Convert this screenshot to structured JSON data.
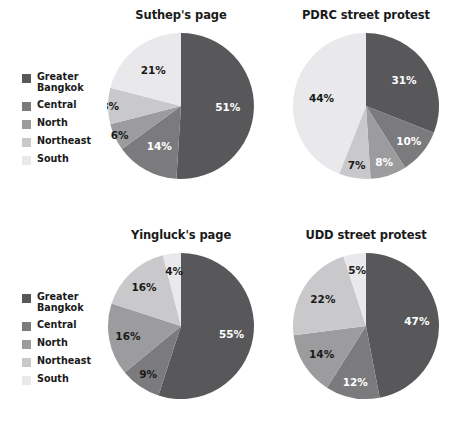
{
  "figure": {
    "background": "#ffffff",
    "width": 465,
    "height": 443
  },
  "legend": {
    "title": "",
    "position": "left-of-row",
    "items": [
      {
        "label": "Greater\nBangkok",
        "color": "#58585a"
      },
      {
        "label": "Central",
        "color": "#7b7b7d"
      },
      {
        "label": "North",
        "color": "#9c9c9e"
      },
      {
        "label": "Northeast",
        "color": "#c9c9cb"
      },
      {
        "label": "South",
        "color": "#e9e9eb"
      }
    ]
  },
  "palette": {
    "greater_bangkok": "#58585a",
    "central": "#7b7b7d",
    "north": "#9c9c9e",
    "northeast": "#c9c9cb",
    "south": "#e9e9eb",
    "label_light": "#ffffff",
    "label_dark": "#1a1a1a",
    "title": "#1a1a1a"
  },
  "chart_data": [
    {
      "type": "pie",
      "title": "Suthep's page",
      "categories": [
        "Greater Bangkok",
        "Central",
        "North",
        "Northeast",
        "South"
      ],
      "values": [
        51,
        14,
        6,
        8,
        21
      ],
      "labels": [
        "51%",
        "14%",
        "6%",
        "8%",
        "21%"
      ],
      "colors": [
        "#58585a",
        "#7b7b7d",
        "#9c9c9e",
        "#c9c9cb",
        "#e9e9eb"
      ],
      "label_colors": [
        "#ffffff",
        "#ffffff",
        "#1a1a1a",
        "#1a1a1a",
        "#1a1a1a"
      ],
      "label_radius": [
        0.64,
        0.62,
        0.93,
        0.97,
        0.62
      ],
      "start_angle": 0,
      "direction": "clockwise",
      "xlabel": "",
      "ylabel": ""
    },
    {
      "type": "pie",
      "title": "PDRC street protest",
      "categories": [
        "Greater Bangkok",
        "Central",
        "North",
        "Northeast",
        "South"
      ],
      "values": [
        31,
        10,
        8,
        7,
        44
      ],
      "labels": [
        "31%",
        "10%",
        "8%",
        "7%",
        "44%"
      ],
      "colors": [
        "#58585a",
        "#7b7b7d",
        "#9c9c9e",
        "#c9c9cb",
        "#e9e9eb"
      ],
      "label_colors": [
        "#ffffff",
        "#ffffff",
        "#ffffff",
        "#1a1a1a",
        "#1a1a1a"
      ],
      "label_radius": [
        0.63,
        0.76,
        0.8,
        0.82,
        0.62
      ],
      "start_angle": 0,
      "direction": "clockwise",
      "xlabel": "",
      "ylabel": ""
    },
    {
      "type": "pie",
      "title": "Yingluck's page",
      "categories": [
        "Greater Bangkok",
        "Central",
        "North",
        "Northeast",
        "South"
      ],
      "values": [
        55,
        9,
        16,
        16,
        4
      ],
      "labels": [
        "55%",
        "9%",
        "16%",
        "16%",
        "4%"
      ],
      "colors": [
        "#58585a",
        "#7b7b7d",
        "#9c9c9e",
        "#c9c9cb",
        "#e9e9eb"
      ],
      "label_colors": [
        "#ffffff",
        "#1a1a1a",
        "#1a1a1a",
        "#1a1a1a",
        "#1a1a1a"
      ],
      "label_radius": [
        0.7,
        0.8,
        0.74,
        0.74,
        0.76
      ],
      "start_angle": 0,
      "direction": "clockwise",
      "xlabel": "",
      "ylabel": ""
    },
    {
      "type": "pie",
      "title": "UDD street protest",
      "categories": [
        "Greater Bangkok",
        "Central",
        "North",
        "Northeast",
        "South"
      ],
      "values": [
        47,
        12,
        14,
        22,
        5
      ],
      "labels": [
        "47%",
        "12%",
        "14%",
        "22%",
        "5%"
      ],
      "colors": [
        "#58585a",
        "#7b7b7d",
        "#9c9c9e",
        "#c9c9cb",
        "#e9e9eb"
      ],
      "label_colors": [
        "#ffffff",
        "#ffffff",
        "#1a1a1a",
        "#1a1a1a",
        "#1a1a1a"
      ],
      "label_radius": [
        0.7,
        0.78,
        0.72,
        0.7,
        0.78
      ],
      "start_angle": 0,
      "direction": "clockwise",
      "xlabel": "",
      "ylabel": ""
    }
  ]
}
